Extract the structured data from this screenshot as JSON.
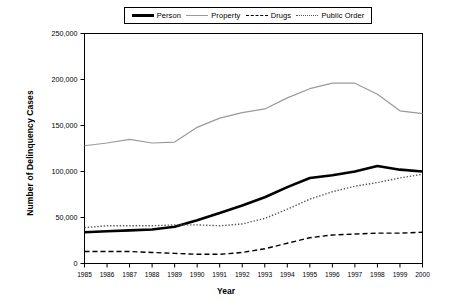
{
  "chart_data": {
    "type": "line",
    "title": "",
    "xlabel": "Year",
    "ylabel": "Number of Delinquency Cases",
    "x": [
      1985,
      1986,
      1987,
      1988,
      1989,
      1990,
      1991,
      1992,
      1993,
      1994,
      1995,
      1996,
      1997,
      1998,
      1999,
      2000
    ],
    "xtick_labels": [
      "1985",
      "1986",
      "1987",
      "1988",
      "1989",
      "1990",
      "1991",
      "1992",
      "1993",
      "1994",
      "1995",
      "1996",
      "1997",
      "1998",
      "1999",
      "2000"
    ],
    "ytick_labels": [
      "0",
      "50,000",
      "100,000",
      "150,000",
      "200,000",
      "250,000"
    ],
    "yticks": [
      0,
      50000,
      100000,
      150000,
      200000,
      250000
    ],
    "ylim": [
      0,
      250000
    ],
    "xlim": [
      1985,
      2000
    ],
    "grid": false,
    "legend_position": "top-center",
    "series": [
      {
        "name": "Person",
        "style": "solid-thick",
        "color": "#000000",
        "values": [
          34000,
          35000,
          36000,
          37000,
          40000,
          47000,
          55000,
          63000,
          72000,
          83000,
          93000,
          96000,
          100000,
          106000,
          102000,
          100000
        ]
      },
      {
        "name": "Property",
        "style": "solid-thin",
        "color": "#9a9a9a",
        "values": [
          128000,
          131000,
          135000,
          131000,
          132000,
          148000,
          158000,
          164000,
          168000,
          180000,
          190000,
          196000,
          196000,
          184000,
          166000,
          163000
        ]
      },
      {
        "name": "Drugs",
        "style": "dashed",
        "color": "#000000",
        "values": [
          13000,
          13000,
          13000,
          12000,
          11000,
          10000,
          10000,
          12000,
          16000,
          22000,
          28000,
          31000,
          32000,
          33000,
          33000,
          34000
        ]
      },
      {
        "name": "Public Order",
        "style": "dotted",
        "color": "#555555",
        "values": [
          39000,
          41000,
          41000,
          41000,
          42000,
          42000,
          41000,
          43000,
          49000,
          59000,
          70000,
          78000,
          84000,
          88000,
          93000,
          97000
        ]
      }
    ]
  },
  "legend": {
    "entries": [
      {
        "label": "Person",
        "icon": "line-solid-thick-swatch"
      },
      {
        "label": "Property",
        "icon": "line-solid-thin-swatch"
      },
      {
        "label": "Drugs",
        "icon": "line-dashed-swatch"
      },
      {
        "label": "Public Order",
        "icon": "line-dotted-swatch"
      }
    ]
  }
}
